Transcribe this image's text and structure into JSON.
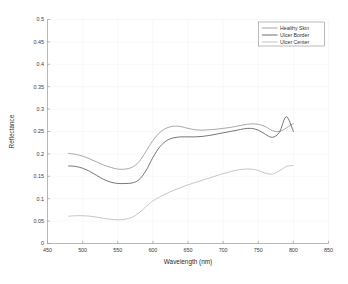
{
  "chart_data": {
    "type": "line",
    "title": "",
    "xlabel": "Wavelength (nm)",
    "ylabel": "Reflectance",
    "xlim": [
      450,
      850
    ],
    "ylim": [
      0,
      0.5
    ],
    "xticks": [
      450,
      500,
      550,
      600,
      650,
      700,
      750,
      800,
      850
    ],
    "xtick_labels": [
      "450",
      "500",
      "550",
      "600",
      "650",
      "700",
      "750",
      "800",
      "850"
    ],
    "yticks": [
      0,
      0.05,
      0.1,
      0.15,
      0.2,
      0.25,
      0.3,
      0.35,
      0.4,
      0.45,
      0.5
    ],
    "ytick_labels": [
      "0",
      "0.05",
      "0.1",
      "0.15",
      "0.2",
      "0.25",
      "0.3",
      "0.35",
      "0.4",
      "0.45",
      "0.5"
    ],
    "grid": true,
    "legend_position": "upper right",
    "x": [
      480,
      490,
      500,
      510,
      520,
      530,
      540,
      550,
      560,
      570,
      580,
      590,
      600,
      610,
      620,
      630,
      640,
      650,
      660,
      670,
      680,
      690,
      700,
      710,
      720,
      730,
      740,
      750,
      760,
      770,
      780,
      790,
      800
    ],
    "series": [
      {
        "name": "Healthy Skin",
        "color": "#8c8c8c",
        "values": [
          0.201,
          0.199,
          0.195,
          0.189,
          0.182,
          0.175,
          0.17,
          0.166,
          0.166,
          0.17,
          0.182,
          0.205,
          0.23,
          0.248,
          0.258,
          0.262,
          0.261,
          0.257,
          0.254,
          0.253,
          0.254,
          0.255,
          0.257,
          0.259,
          0.262,
          0.265,
          0.267,
          0.266,
          0.261,
          0.252,
          0.25,
          0.258,
          0.268
        ]
      },
      {
        "name": "Ulcer Border",
        "color": "#4a4a4a",
        "values": [
          0.173,
          0.172,
          0.168,
          0.161,
          0.152,
          0.143,
          0.137,
          0.134,
          0.134,
          0.135,
          0.142,
          0.162,
          0.192,
          0.216,
          0.23,
          0.236,
          0.238,
          0.238,
          0.238,
          0.239,
          0.241,
          0.244,
          0.247,
          0.25,
          0.253,
          0.256,
          0.257,
          0.253,
          0.244,
          0.237,
          0.248,
          0.283,
          0.25
        ]
      },
      {
        "name": "Ulcer Center",
        "color": "#b4b4b4",
        "values": [
          0.061,
          0.062,
          0.062,
          0.061,
          0.059,
          0.056,
          0.054,
          0.053,
          0.054,
          0.058,
          0.068,
          0.082,
          0.095,
          0.104,
          0.112,
          0.119,
          0.125,
          0.131,
          0.136,
          0.141,
          0.146,
          0.151,
          0.156,
          0.16,
          0.164,
          0.166,
          0.166,
          0.163,
          0.157,
          0.155,
          0.162,
          0.172,
          0.174
        ]
      }
    ]
  },
  "legend": {
    "entries": [
      {
        "label": "Healthy Skin"
      },
      {
        "label": "Ulcer Border"
      },
      {
        "label": "Ulcer Center"
      }
    ]
  }
}
